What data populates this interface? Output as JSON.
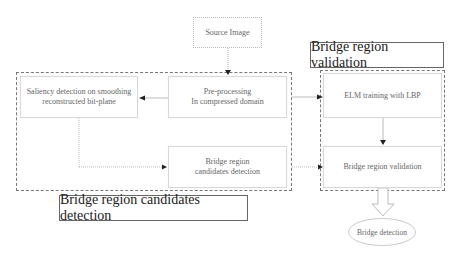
{
  "diagram": {
    "nodes": {
      "source_image": "Source Image",
      "saliency": {
        "line1": "Saliency detection on smoothing",
        "line2": "reconstructed bit-plane"
      },
      "preprocessing": {
        "line1": "Pre-processing",
        "line2": "In compressed domain"
      },
      "candidates": {
        "line1": "Bridge region",
        "line2": "candidates detection"
      },
      "elm": "ELM training with LBP",
      "validation": "Bridge region validation",
      "bridge_detection": "Bridge detection"
    },
    "groups": {
      "candidates_group_label": "Bridge region candidates detection",
      "validation_group_label": "Bridge region validation"
    },
    "edges": [
      {
        "from": "source_image",
        "to": "preprocessing"
      },
      {
        "from": "preprocessing",
        "to": "saliency"
      },
      {
        "from": "preprocessing",
        "to": "elm"
      },
      {
        "from": "saliency",
        "to": "candidates"
      },
      {
        "from": "candidates",
        "to": "validation"
      },
      {
        "from": "elm",
        "to": "validation"
      },
      {
        "from": "validation",
        "to": "bridge_detection"
      }
    ]
  }
}
